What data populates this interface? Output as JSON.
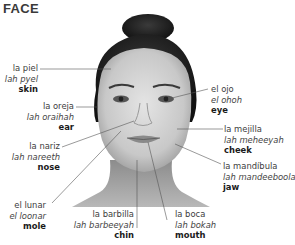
{
  "title": "FACE",
  "labels": [
    {
      "id": "skin",
      "spanish": "la piel",
      "pronunciation": "lah pyel",
      "english": "skin"
    },
    {
      "id": "ear",
      "spanish": "la oreja",
      "pronunciation": "lah oraihah",
      "english": "ear"
    },
    {
      "id": "nose",
      "spanish": "la nariz",
      "pronunciation": "lah nareeth",
      "english": "nose"
    },
    {
      "id": "mole",
      "spanish": "el lunar",
      "pronunciation": "el loonar",
      "english": "mole"
    },
    {
      "id": "chin",
      "spanish": "la barbilla",
      "pronunciation": "lah barbeeyah",
      "english": "chin"
    },
    {
      "id": "mouth",
      "spanish": "la boca",
      "pronunciation": "lah bokah",
      "english": "mouth"
    },
    {
      "id": "eye",
      "spanish": "el ojo",
      "pronunciation": "el ohoh",
      "english": "eye"
    },
    {
      "id": "cheek",
      "spanish": "la mejilla",
      "pronunciation": "lah meheeyah",
      "english": "cheek"
    },
    {
      "id": "jaw",
      "spanish": "la mandíbula",
      "pronunciation": "lah mandeeboolah",
      "english": "jaw"
    }
  ]
}
